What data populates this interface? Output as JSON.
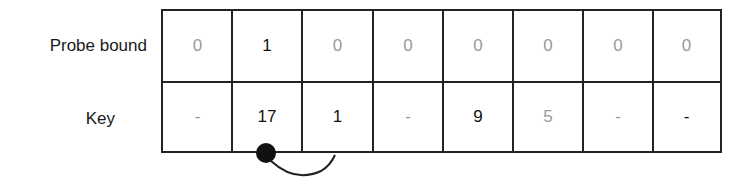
{
  "rows": [
    {
      "label": "Probe bound",
      "cells": [
        {
          "value": "0",
          "highlight": false
        },
        {
          "value": "1",
          "highlight": true
        },
        {
          "value": "0",
          "highlight": false
        },
        {
          "value": "0",
          "highlight": false
        },
        {
          "value": "0",
          "highlight": false
        },
        {
          "value": "0",
          "highlight": false
        },
        {
          "value": "0",
          "highlight": false
        },
        {
          "value": "0",
          "highlight": false
        }
      ]
    },
    {
      "label": "Key",
      "cells": [
        {
          "value": "-",
          "highlight": false
        },
        {
          "value": "17",
          "highlight": true
        },
        {
          "value": "1",
          "highlight": true
        },
        {
          "value": "-",
          "highlight": false
        },
        {
          "value": "9",
          "highlight": true
        },
        {
          "value": "5",
          "highlight": false
        },
        {
          "value": "-",
          "highlight": false
        },
        {
          "value": "-",
          "highlight": true
        }
      ]
    }
  ],
  "pointer": {
    "from_column": 1,
    "to_column": 2,
    "description": "arc from slot 1 to slot 2"
  },
  "colors": {
    "line": "#222222",
    "dark_text": "#111111",
    "light_text": "#9a9a9a"
  }
}
